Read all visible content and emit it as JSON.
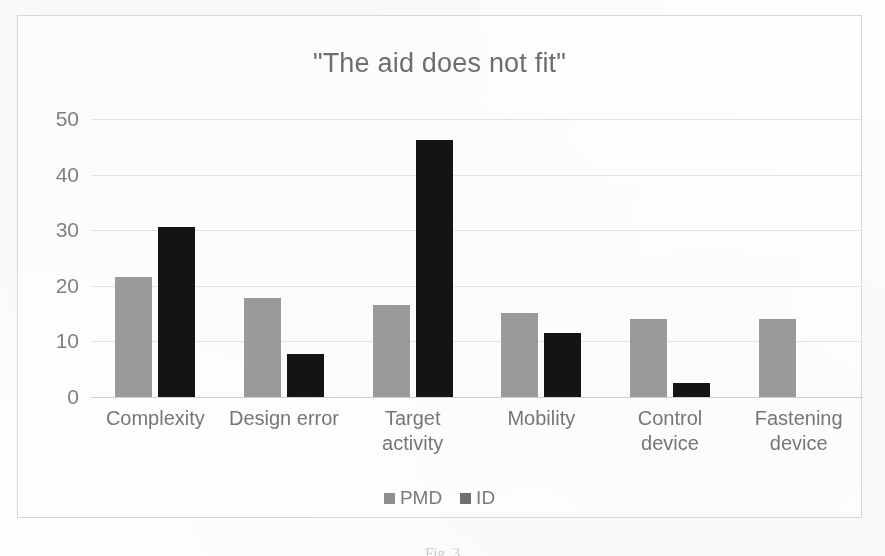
{
  "figure": {
    "caption_partial": "Fig. 3"
  },
  "chart_data": {
    "type": "bar",
    "title": "\"The aid does not fit\"",
    "xlabel": "",
    "ylabel": "",
    "ylim": [
      0,
      50
    ],
    "yticks": [
      50,
      40,
      30,
      20,
      10,
      0
    ],
    "grid": true,
    "legend_position": "bottom",
    "categories": [
      "Complexity",
      "Design error",
      "Target activity",
      "Mobility",
      "Control device",
      "Fastening device"
    ],
    "category_lines": [
      [
        "Complexity"
      ],
      [
        "Design error"
      ],
      [
        "Target",
        "activity"
      ],
      [
        "Mobility"
      ],
      [
        "Control",
        "device"
      ],
      [
        "Fastening",
        "device"
      ]
    ],
    "series": [
      {
        "name": "PMD",
        "color": "#9a9a9a",
        "values": [
          21.5,
          17.8,
          16.5,
          15.2,
          14.0,
          14.0
        ]
      },
      {
        "name": "ID",
        "color": "#141414",
        "values": [
          30.6,
          7.8,
          46.3,
          11.6,
          2.6,
          0
        ]
      }
    ]
  }
}
